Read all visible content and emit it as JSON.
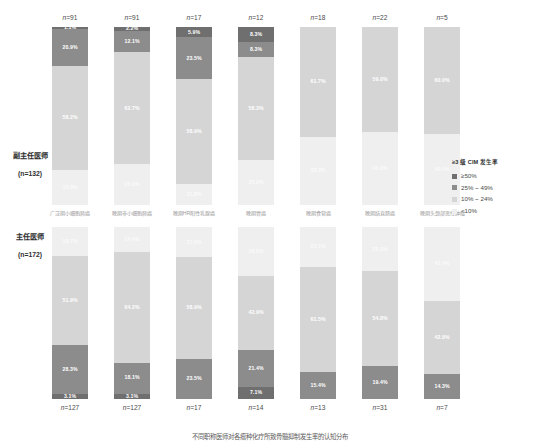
{
  "chart_data": {
    "type": "bar",
    "subtype": "stacked-percentage",
    "title": "",
    "xlabel": "",
    "ylabel": "",
    "ylim": [
      0,
      100
    ],
    "grid": false,
    "legend_position": "right",
    "legend_title": "≥3 级 CIM 发生率",
    "legend_entries": [
      {
        "label": "≥50%",
        "color": "#6f6f6f"
      },
      {
        "label": "25% ~ 49%",
        "color": "#8c8c8c"
      },
      {
        "label": "10% ~ 24%",
        "color": "#d5d5d5"
      },
      {
        "label": "<10%",
        "color": "#efefef"
      }
    ],
    "categories": [
      "广泛期小细胞肺癌",
      "晚期非小细胞肺癌",
      "晚期HR阳性乳腺癌",
      "晚期胃癌",
      "晚期食管癌",
      "晚期结直肠癌",
      "晚期头颈部恶性肿瘤"
    ],
    "panels": [
      {
        "row_label": "副主任医师",
        "row_sublabel": "(n=132)",
        "n_labels": [
          "n=91",
          "n=91",
          "n=17",
          "n=12",
          "n=18",
          "n=22",
          "n=5"
        ],
        "n_values": [
          91,
          91,
          17,
          12,
          18,
          22,
          5
        ],
        "bars": [
          {
            "category": "广泛期小细胞肺癌",
            "segments": [
              {
                "level": "≥50%",
                "value": 1.1,
                "label": "1.1%"
              },
              {
                "level": "25% ~ 49%",
                "value": 20.9,
                "label": "20.9%"
              },
              {
                "level": "10% ~ 24%",
                "value": 58.2,
                "label": "58.2%"
              },
              {
                "level": "<10%",
                "value": 19.8,
                "label": "19.8%"
              }
            ]
          },
          {
            "category": "晚期非小细胞肺癌",
            "segments": [
              {
                "level": "≥50%",
                "value": 2.2,
                "label": "2.2%"
              },
              {
                "level": "25% ~ 49%",
                "value": 12.1,
                "label": "12.1%"
              },
              {
                "level": "10% ~ 24%",
                "value": 62.7,
                "label": "62.7%"
              },
              {
                "level": "<10%",
                "value": 23.0,
                "label": "23.0%"
              }
            ]
          },
          {
            "category": "晚期HR阳性乳腺癌",
            "segments": [
              {
                "level": "≥50%",
                "value": 5.9,
                "label": "5.9%"
              },
              {
                "level": "25% ~ 49%",
                "value": 23.5,
                "label": "23.5%"
              },
              {
                "level": "10% ~ 24%",
                "value": 58.9,
                "label": "58.9%"
              },
              {
                "level": "<10%",
                "value": 11.8,
                "label": "11.8%"
              }
            ]
          },
          {
            "category": "晚期胃癌",
            "segments": [
              {
                "level": "≥50%",
                "value": 8.3,
                "label": "8.3%"
              },
              {
                "level": "25% ~ 49%",
                "value": 8.3,
                "label": "8.3%"
              },
              {
                "level": "10% ~ 24%",
                "value": 58.3,
                "label": "58.3%"
              },
              {
                "level": "<10%",
                "value": 25.0,
                "label": "25.0%"
              }
            ]
          },
          {
            "category": "晚期食管癌",
            "segments": [
              {
                "level": "10% ~ 24%",
                "value": 61.7,
                "label": "61.7%"
              },
              {
                "level": "<10%",
                "value": 38.3,
                "label": "38.3%"
              }
            ]
          },
          {
            "category": "晚期结直肠癌",
            "segments": [
              {
                "level": "10% ~ 24%",
                "value": 59.0,
                "label": "59.0%"
              },
              {
                "level": "<10%",
                "value": 41.0,
                "label": "41.0%"
              }
            ]
          },
          {
            "category": "晚期头颈部恶性肿瘤",
            "segments": [
              {
                "level": "10% ~ 24%",
                "value": 60.0,
                "label": "60.0%"
              },
              {
                "level": "<10%",
                "value": 40.0,
                "label": "40.0%"
              }
            ]
          }
        ]
      },
      {
        "row_label": "主任医师",
        "row_sublabel": "(n=172)",
        "n_labels": [
          "n=127",
          "n=127",
          "n=17",
          "n=14",
          "n=13",
          "n=31",
          "n=7"
        ],
        "n_values": [
          127,
          127,
          17,
          14,
          13,
          31,
          7
        ],
        "bars": [
          {
            "category": "广泛期小细胞肺癌",
            "segments": [
              {
                "level": "<10%",
                "value": 16.7,
                "label": "16.7%"
              },
              {
                "level": "10% ~ 24%",
                "value": 51.9,
                "label": "51.9%"
              },
              {
                "level": "25% ~ 49%",
                "value": 28.3,
                "label": "28.3%"
              },
              {
                "level": "≥50%",
                "value": 3.1,
                "label": "3.1%"
              }
            ]
          },
          {
            "category": "晚期非小细胞肺癌",
            "segments": [
              {
                "level": "<10%",
                "value": 14.6,
                "label": "14.6%"
              },
              {
                "level": "10% ~ 24%",
                "value": 64.2,
                "label": "64.2%"
              },
              {
                "level": "25% ~ 49%",
                "value": 18.1,
                "label": "18.1%"
              },
              {
                "level": "≥50%",
                "value": 3.1,
                "label": "3.1%"
              }
            ]
          },
          {
            "category": "晚期HR阳性乳腺癌",
            "segments": [
              {
                "level": "<10%",
                "value": 17.6,
                "label": "17.6%"
              },
              {
                "level": "10% ~ 24%",
                "value": 58.9,
                "label": "58.9%"
              },
              {
                "level": "25% ~ 49%",
                "value": 23.5,
                "label": "23.5%"
              }
            ]
          },
          {
            "category": "晚期胃癌",
            "segments": [
              {
                "level": "<10%",
                "value": 28.6,
                "label": "28.6%"
              },
              {
                "level": "10% ~ 24%",
                "value": 42.9,
                "label": "42.9%"
              },
              {
                "level": "25% ~ 49%",
                "value": 21.4,
                "label": "21.4%"
              },
              {
                "level": "≥50%",
                "value": 7.1,
                "label": "7.1%"
              }
            ]
          },
          {
            "category": "晚期食管癌",
            "segments": [
              {
                "level": "<10%",
                "value": 23.1,
                "label": "23.1%"
              },
              {
                "level": "10% ~ 24%",
                "value": 61.5,
                "label": "61.5%"
              },
              {
                "level": "25% ~ 49%",
                "value": 15.4,
                "label": "15.4%"
              }
            ]
          },
          {
            "category": "晚期结直肠癌",
            "segments": [
              {
                "level": "<10%",
                "value": 25.8,
                "label": "25.8%"
              },
              {
                "level": "10% ~ 24%",
                "value": 54.8,
                "label": "54.8%"
              },
              {
                "level": "25% ~ 49%",
                "value": 19.4,
                "label": "19.4%"
              }
            ]
          },
          {
            "category": "晚期头颈部恶性肿瘤",
            "segments": [
              {
                "level": "<10%",
                "value": 42.9,
                "label": "42.9%"
              },
              {
                "level": "10% ~ 24%",
                "value": 42.9,
                "label": "42.9%"
              },
              {
                "level": "25% ~ 49%",
                "value": 14.3,
                "label": "14.3%"
              }
            ]
          }
        ]
      }
    ]
  },
  "caption": "不同职称医师对各瘤种化疗所致骨髓抑制发生率的认知分布"
}
